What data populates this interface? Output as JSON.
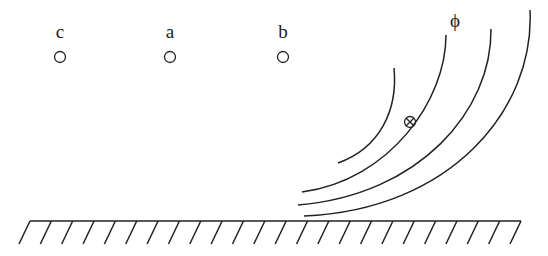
{
  "figure": {
    "points": [
      {
        "label": "c",
        "x": 60,
        "y": 57
      },
      {
        "label": "a",
        "x": 170,
        "y": 57
      },
      {
        "label": "b",
        "x": 283,
        "y": 57
      }
    ],
    "field_label": "ϕ",
    "current_marker": {
      "symbol": "⊗",
      "x": 410,
      "y": 122,
      "meaning": "current into page"
    },
    "field_lines_count": 4,
    "ground_hatch_count": 24
  }
}
